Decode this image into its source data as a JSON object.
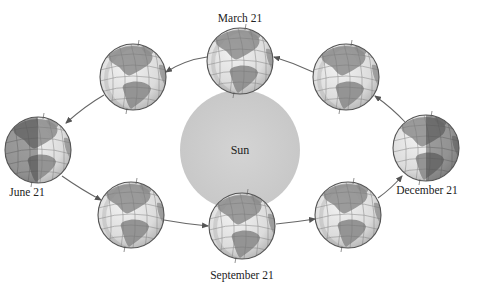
{
  "diagram": {
    "title": "",
    "sun": {
      "label": "Sun",
      "cx": 240,
      "cy": 150,
      "r": 60,
      "color": "#cfcfcf"
    },
    "globe_radius": 33,
    "colors": {
      "ocean_lit": "#e4e4e4",
      "ocean_dark": "#9a9a9a",
      "land_lit": "#8c8c8c",
      "land_dark": "#5e5e5e",
      "grid": "#777777",
      "outline": "#555555",
      "orbit": "#666666"
    },
    "globes": [
      {
        "id": "march",
        "cx": 240,
        "cy": 61,
        "label": "March 21",
        "label_x": 240,
        "label_y": 22,
        "shade": "none"
      },
      {
        "id": "top-left",
        "cx": 133,
        "cy": 77,
        "label": "",
        "shade": "none"
      },
      {
        "id": "june",
        "cx": 38,
        "cy": 150,
        "label": "June 21",
        "label_x": 27,
        "label_y": 196,
        "shade": "left"
      },
      {
        "id": "bottom-left",
        "cx": 131,
        "cy": 215,
        "label": "",
        "shade": "none"
      },
      {
        "id": "september",
        "cx": 242,
        "cy": 226,
        "label": "September 21",
        "label_x": 242,
        "label_y": 279,
        "shade": "none"
      },
      {
        "id": "bottom-right",
        "cx": 348,
        "cy": 215,
        "label": "",
        "shade": "none"
      },
      {
        "id": "december",
        "cx": 426,
        "cy": 148,
        "label": "December 21",
        "label_x": 427,
        "label_y": 194,
        "shade": "right"
      },
      {
        "id": "top-right",
        "cx": 346,
        "cy": 77,
        "label": "",
        "shade": "none"
      }
    ],
    "labels": {
      "march": "March 21",
      "june": "June 21",
      "september": "September 21",
      "december": "December 21",
      "sun": "Sun"
    },
    "orbit_direction": "counterclockwise (as viewed: March → top-left → June → bottom-left → September → bottom-right → December → top-right → March)"
  }
}
